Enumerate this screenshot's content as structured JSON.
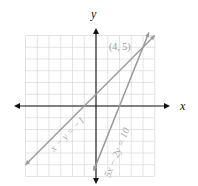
{
  "chart_data": {
    "type": "line",
    "title": "",
    "xlabel": "x",
    "ylabel": "y",
    "xlim": [
      -6,
      5
    ],
    "ylim": [
      -6,
      6
    ],
    "grid": true,
    "legend": "none (inline labels)",
    "series": [
      {
        "name": "x - y = -1",
        "label": "x − y = −1",
        "equation": "y = x + 1",
        "slope": 1,
        "intercept": 1,
        "points": [
          [
            -6,
            -5
          ],
          [
            5,
            6
          ]
        ]
      },
      {
        "name": "5x - 2y = 10",
        "label": "5x − 2y = 10",
        "equation": "y = 2.5x - 5",
        "slope": 2.5,
        "intercept": -5,
        "points": [
          [
            -0.2,
            -5.5
          ],
          [
            4.5,
            6.25
          ]
        ]
      }
    ],
    "annotations": [
      {
        "text": "(4, 5)",
        "x": 4,
        "y": 5,
        "note": "intersection point"
      }
    ]
  },
  "labels": {
    "x_axis": "x",
    "y_axis": "y",
    "line1": "x − y = −1",
    "line2": "5x − 2y = 10",
    "intersection": "(4, 5)"
  }
}
